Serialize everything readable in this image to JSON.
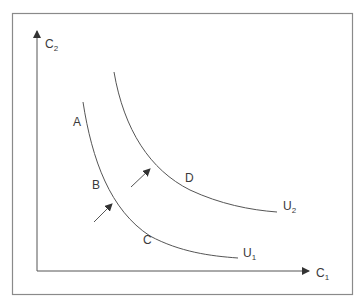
{
  "diagram": {
    "type": "indifference-curves",
    "axes": {
      "x_label": "C",
      "x_sub": "1",
      "y_label": "C",
      "y_sub": "2"
    },
    "curves": [
      {
        "label": "U",
        "sub": "1"
      },
      {
        "label": "U",
        "sub": "2"
      }
    ],
    "points": {
      "a": "A",
      "b": "B",
      "c": "C",
      "d": "D"
    },
    "arrows": [
      "shift-arrow-lower",
      "shift-arrow-upper"
    ],
    "colors": {
      "line": "#555555",
      "frame": "#888888",
      "text": "#3a3a3a"
    }
  }
}
